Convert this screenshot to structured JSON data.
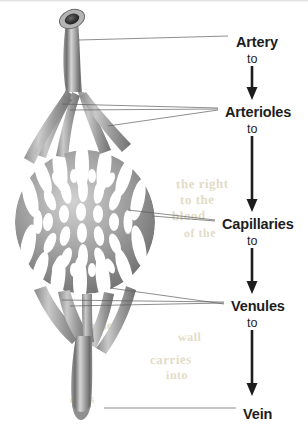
{
  "figure": {
    "background_color": "#ffffff",
    "ink_color": "#1d1d1d",
    "vessel_color": "#8d8d8d",
    "bleed_color": "#e3dcc6"
  },
  "flow": {
    "connector_word": "to",
    "steps": [
      {
        "label": "Artery",
        "x": 236,
        "y": 34,
        "to_x": 247,
        "to_y": 52,
        "arrow_x": 252,
        "arrow_top": 66,
        "arrow_bottom": 100
      },
      {
        "label": "Arterioles",
        "x": 225,
        "y": 104,
        "to_x": 247,
        "to_y": 122,
        "arrow_x": 252,
        "arrow_top": 136,
        "arrow_bottom": 212
      },
      {
        "label": "Capillaries",
        "x": 222,
        "y": 216,
        "to_x": 247,
        "to_y": 234,
        "arrow_x": 252,
        "arrow_top": 248,
        "arrow_bottom": 294
      },
      {
        "label": "Venules",
        "x": 231,
        "y": 298,
        "to_x": 247,
        "to_y": 316,
        "arrow_x": 252,
        "arrow_top": 330,
        "arrow_bottom": 396
      },
      {
        "label": "Vein",
        "x": 243,
        "y": 406,
        "to_x": null,
        "to_y": null,
        "arrow_x": null,
        "arrow_top": null,
        "arrow_bottom": null
      }
    ]
  },
  "leaders": {
    "artery": [
      [
        79,
        40,
        228,
        36
      ]
    ],
    "arterioles": [
      [
        62,
        104,
        218,
        108
      ],
      [
        70,
        110,
        218,
        109
      ],
      [
        108,
        126,
        218,
        110
      ]
    ],
    "capillaries": [
      [
        128,
        210,
        215,
        220
      ],
      [
        152,
        216,
        215,
        221
      ]
    ],
    "venules": [
      [
        62,
        300,
        224,
        302
      ],
      [
        70,
        306,
        224,
        303
      ],
      [
        110,
        288,
        224,
        304
      ]
    ],
    "vein": [
      [
        104,
        408,
        236,
        408
      ]
    ]
  },
  "bleed_text": [
    {
      "text": "the right",
      "x": 176,
      "y": 176,
      "size": 13,
      "rotate": -1
    },
    {
      "text": "to the",
      "x": 180,
      "y": 192,
      "size": 13,
      "rotate": -1
    },
    {
      "text": "blood",
      "x": 172,
      "y": 208,
      "size": 13,
      "rotate": -1
    },
    {
      "text": "of the",
      "x": 184,
      "y": 226,
      "size": 12,
      "rotate": -1
    },
    {
      "text": "the vessels",
      "x": 60,
      "y": 318,
      "size": 13,
      "rotate": -1
    },
    {
      "text": "wall",
      "x": 178,
      "y": 330,
      "size": 12,
      "rotate": -1
    },
    {
      "text": "carries",
      "x": 150,
      "y": 352,
      "size": 13,
      "rotate": -1
    },
    {
      "text": "into",
      "x": 166,
      "y": 368,
      "size": 12,
      "rotate": -1
    },
    {
      "text": "cells",
      "x": 70,
      "y": 392,
      "size": 12,
      "rotate": -1
    }
  ],
  "illustration": {
    "artery_lumen": {
      "cx": 68,
      "cy": 17,
      "label": "cut-open vessel end showing dark lumen"
    },
    "capillary_bed": {
      "cx": 85,
      "cy": 222,
      "rx": 70,
      "ry": 72,
      "label": "dense anastomosing capillary mesh"
    }
  }
}
